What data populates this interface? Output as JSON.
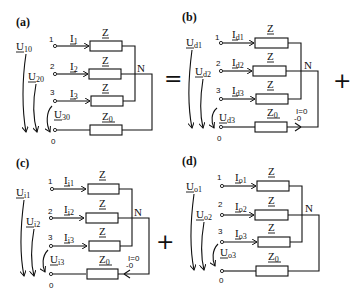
{
  "figure": {
    "panels": [
      {
        "id": "a",
        "label": "(a)",
        "voltages": [
          "U",
          "U",
          "U"
        ],
        "voltage_subs": [
          "10",
          "20",
          "30"
        ],
        "currents": [
          "I",
          "I",
          "I"
        ],
        "current_subs": [
          "1",
          "2",
          "3"
        ],
        "terminals": [
          "1",
          "2",
          "3",
          "0"
        ],
        "impedances": [
          "Z",
          "Z",
          "Z",
          "Z"
        ],
        "z0_sub": "0",
        "neutral": "N",
        "neutral_current": ""
      },
      {
        "id": "b",
        "label": "(b)",
        "voltages": [
          "U",
          "U",
          "U"
        ],
        "voltage_subs": [
          "d1",
          "d2",
          "d3"
        ],
        "currents": [
          "I",
          "I",
          "I"
        ],
        "current_subs": [
          "d1",
          "d2",
          "d3"
        ],
        "terminals": [
          "1",
          "2",
          "3",
          "0"
        ],
        "impedances": [
          "Z",
          "Z",
          "Z",
          "Z"
        ],
        "z0_sub": "0",
        "neutral": "N",
        "neutral_current": "I=0",
        "neutral_current_sub": "-0"
      },
      {
        "id": "c",
        "label": "(c)",
        "voltages": [
          "U",
          "U",
          "U"
        ],
        "voltage_subs": [
          "i1",
          "i2",
          "i3"
        ],
        "currents": [
          "I",
          "I",
          "I"
        ],
        "current_subs": [
          "i1",
          "i2",
          "i3"
        ],
        "terminals": [
          "1",
          "2",
          "3",
          "0"
        ],
        "impedances": [
          "Z",
          "Z",
          "Z",
          "Z"
        ],
        "z0_sub": "0",
        "neutral": "N",
        "neutral_current": "I=0",
        "neutral_current_sub": "-0"
      },
      {
        "id": "d",
        "label": "(d)",
        "voltages": [
          "U",
          "U",
          "U"
        ],
        "voltage_subs": [
          "o1",
          "o2",
          "o3"
        ],
        "currents": [
          "I",
          "I",
          "I"
        ],
        "current_subs": [
          "o1",
          "o2",
          "o3"
        ],
        "terminals": [
          "1",
          "2",
          "3",
          "0"
        ],
        "impedances": [
          "Z",
          "Z",
          "Z",
          "Z"
        ],
        "z0_sub": "0",
        "neutral": "N",
        "neutral_current": ""
      }
    ],
    "operators": {
      "equals": "=",
      "plus_top": "+",
      "plus_bottom": "+"
    }
  }
}
